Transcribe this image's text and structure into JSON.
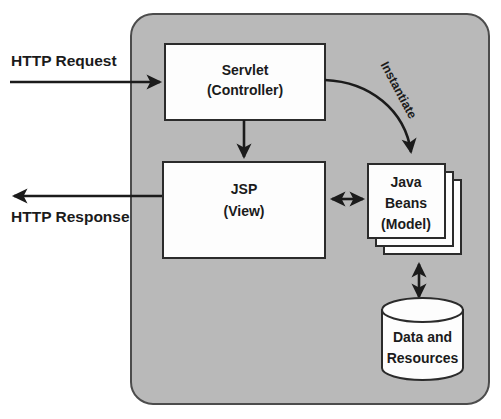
{
  "diagram": {
    "container": {
      "name": "web-application-container",
      "fill": "#b9b9b9",
      "stroke": "#4c4c4c"
    },
    "colors": {
      "container_gray": "#b9b9b9",
      "node_fill": "#fdfdfd",
      "stroke_dark": "#1b1b1b",
      "page_background": "#ffffff"
    },
    "external_labels": [
      {
        "id": "http-request",
        "text": "HTTP Request"
      },
      {
        "id": "http-response",
        "text": "HTTP Response"
      }
    ],
    "nodes": [
      {
        "id": "servlet",
        "shape": "rectangle",
        "lines": [
          "Servlet",
          "(Controller)"
        ]
      },
      {
        "id": "jsp",
        "shape": "rectangle",
        "lines": [
          "JSP",
          "(View)"
        ]
      },
      {
        "id": "java-beans",
        "shape": "stacked-rectangle",
        "stack_count": 3,
        "lines": [
          "Java",
          "Beans",
          "(Model)"
        ]
      },
      {
        "id": "data-and-resources",
        "shape": "cylinder",
        "lines": [
          "Data and",
          "Resources"
        ]
      }
    ],
    "edges": [
      {
        "id": "request-to-servlet",
        "from": "client",
        "to": "servlet",
        "label": "",
        "arrow": "single"
      },
      {
        "id": "jsp-to-response",
        "from": "jsp",
        "to": "client",
        "label": "",
        "arrow": "single"
      },
      {
        "id": "servlet-to-jsp",
        "from": "servlet",
        "to": "jsp",
        "label": "",
        "arrow": "single"
      },
      {
        "id": "servlet-to-beans",
        "from": "servlet",
        "to": "java-beans",
        "label": "Instantiate",
        "arrow": "single-curved"
      },
      {
        "id": "jsp-to-beans",
        "from": "jsp",
        "to": "java-beans",
        "label": "",
        "arrow": "double"
      },
      {
        "id": "beans-to-data",
        "from": "java-beans",
        "to": "data-and-resources",
        "label": "",
        "arrow": "double"
      }
    ]
  }
}
